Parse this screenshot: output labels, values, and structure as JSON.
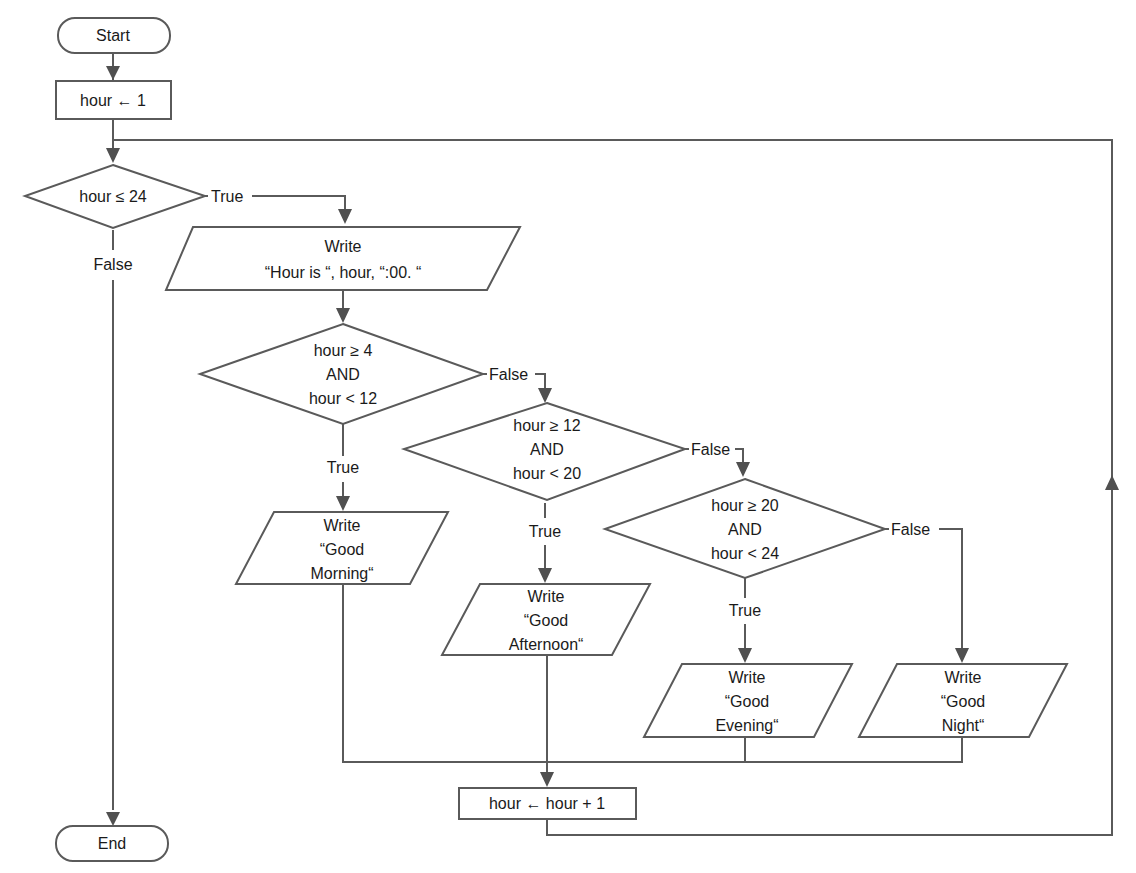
{
  "diagram": {
    "type": "flowchart",
    "stroke_color": "#5a5a5a",
    "arrow_color": "#505050",
    "background": "#ffffff",
    "nodes": {
      "start": {
        "kind": "terminator",
        "text": "Start"
      },
      "init": {
        "kind": "process",
        "text": "hour ← 1"
      },
      "loop_cond": {
        "kind": "decision",
        "text": "hour ≤ 24"
      },
      "write_hour": {
        "kind": "io",
        "lines": [
          "Write",
          "“Hour is “, hour, “:00. “"
        ]
      },
      "cond_morning": {
        "kind": "decision",
        "lines": [
          "hour ≥ 4",
          "AND",
          "hour < 12"
        ]
      },
      "cond_afternoon": {
        "kind": "decision",
        "lines": [
          "hour ≥ 12",
          "AND",
          "hour < 20"
        ]
      },
      "cond_evening": {
        "kind": "decision",
        "lines": [
          "hour ≥ 20",
          "AND",
          "hour < 24"
        ]
      },
      "write_morning": {
        "kind": "io",
        "lines": [
          "Write",
          "“Good",
          "Morning“"
        ]
      },
      "write_afternoon": {
        "kind": "io",
        "lines": [
          "Write",
          "“Good",
          "Afternoon“"
        ]
      },
      "write_evening": {
        "kind": "io",
        "lines": [
          "Write",
          "“Good",
          "Evening“"
        ]
      },
      "write_night": {
        "kind": "io",
        "lines": [
          "Write",
          "“Good",
          "Night“"
        ]
      },
      "increment": {
        "kind": "process",
        "text": "hour ← hour + 1"
      },
      "end": {
        "kind": "terminator",
        "text": "End"
      }
    },
    "edge_labels": {
      "loop_true": "True",
      "loop_false": "False",
      "morning_true": "True",
      "morning_false": "False",
      "afternoon_true": "True",
      "afternoon_false": "False",
      "evening_true": "True",
      "evening_false": "False"
    },
    "edges": [
      {
        "from": "start",
        "to": "init"
      },
      {
        "from": "init",
        "to": "loop_cond"
      },
      {
        "from": "loop_cond",
        "to": "write_hour",
        "label": "True"
      },
      {
        "from": "loop_cond",
        "to": "end",
        "label": "False"
      },
      {
        "from": "write_hour",
        "to": "cond_morning"
      },
      {
        "from": "cond_morning",
        "to": "write_morning",
        "label": "True"
      },
      {
        "from": "cond_morning",
        "to": "cond_afternoon",
        "label": "False"
      },
      {
        "from": "cond_afternoon",
        "to": "write_afternoon",
        "label": "True"
      },
      {
        "from": "cond_afternoon",
        "to": "cond_evening",
        "label": "False"
      },
      {
        "from": "cond_evening",
        "to": "write_evening",
        "label": "True"
      },
      {
        "from": "cond_evening",
        "to": "write_night",
        "label": "False"
      },
      {
        "from": "write_morning",
        "to": "increment"
      },
      {
        "from": "write_afternoon",
        "to": "increment"
      },
      {
        "from": "write_evening",
        "to": "increment"
      },
      {
        "from": "write_night",
        "to": "increment"
      },
      {
        "from": "increment",
        "to": "loop_cond"
      }
    ]
  }
}
